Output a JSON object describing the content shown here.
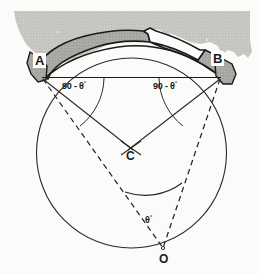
{
  "figure": {
    "background_color": "#fbfbfa",
    "ground_fill_color": "#c9c7c4",
    "arch_fill_color": "#a9a7a4",
    "line_color": "#1b1b1b",
    "labels": {
      "point_a": "A",
      "point_b": "B",
      "point_c": "C",
      "point_o": "O"
    },
    "angles": {
      "left_base_angle": "90 - θ",
      "left_base_angle_degree_mark": "°",
      "right_base_angle": "90 - θ",
      "right_base_angle_degree_mark": "°",
      "central_angle": "θ",
      "central_angle_degree_mark": "°"
    },
    "geometry": {
      "circle_center_x": 131.5,
      "circle_center_y": 153,
      "circle_radius": 95,
      "point_a_x": 42,
      "point_a_y": 78,
      "point_b_x": 221,
      "point_b_y": 78,
      "point_c_x": 131,
      "point_c_y": 148,
      "point_o_x": 163,
      "point_o_y": 248,
      "chord_y": 77
    }
  }
}
